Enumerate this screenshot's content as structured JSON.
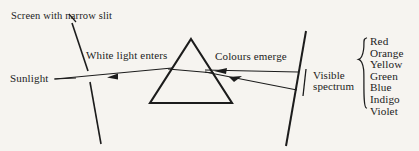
{
  "figure": {
    "background_color": "#f6f4f0",
    "ink_color": "#1c1c1c",
    "labels": {
      "screen_with_slit": "Screen with narrow slit",
      "white_light_enters": "White light enters",
      "sunlight": "Sunlight",
      "colours_emerge": "Colours emerge",
      "visible_spectrum_line1": "Visible",
      "visible_spectrum_line2": "spectrum"
    },
    "spectrum_colours": [
      "Red",
      "Orange",
      "Yellow",
      "Green",
      "Blue",
      "Indigo",
      "Violet"
    ]
  }
}
